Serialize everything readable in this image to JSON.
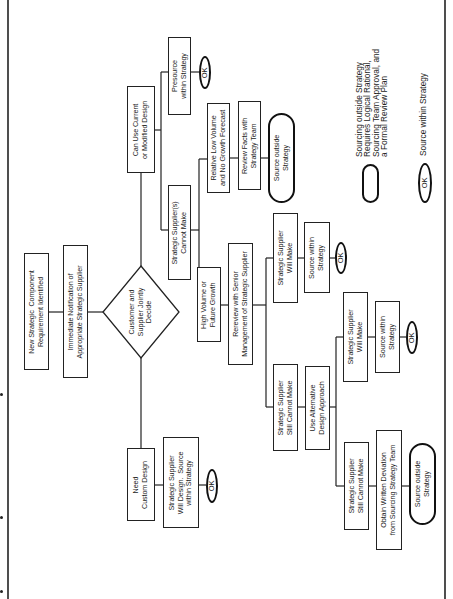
{
  "diagram": {
    "orientation": "rotated-90-ccw",
    "start": {
      "new_requirement": "New Strategic  Component\nRequirement Identified",
      "notification": "Immediate Notification of\nAppropriate Strategic Supplier"
    },
    "decision": "Customer and\nSupplier Jointly\nDecide",
    "branch_current": {
      "label": "Can Use Current\nor Modified Design",
      "presource": "Presource\nwithin Strategy",
      "ok": "OK"
    },
    "branch_cannot_make": {
      "label": "Strategic Supplier(s)\nCannot Make",
      "low_volume": {
        "label": "Relative Low Volume\nand No Growth Forecast",
        "review": "Review Facts with\nStrategy Team",
        "outcome": "Source outside\nStrategy"
      },
      "high_volume": {
        "label": "High Volume or\nFuture Growth",
        "review": "Rereview with Senior\nManagement of Strategic Supplier",
        "will_make": {
          "label": "Strategic Supplier\nWill Make",
          "outcome": "Source within\nStrategy",
          "ok": "OK"
        },
        "still_cannot": {
          "label": "Strategic Supplier\nStill Cannot Make",
          "alternative": "Use Alternative\nDesign Approach",
          "will_make": {
            "label": "Strategic Supplier\nWill Make",
            "outcome": "Source within\nStrategy",
            "ok": "OK"
          },
          "still_cannot": {
            "label": "Strategic Supplier\nStill Cannot Make",
            "deviation": "Obtain Written Deviation\nfrom Sourcing Strategy Team",
            "outcome": "Source outside\nStrategy"
          }
        }
      }
    },
    "branch_custom": {
      "label": "Need\nCustom Design",
      "will_design": "Strategic Supplier\nWill Design.  Source\nwithin Strategy",
      "ok": "OK"
    },
    "legend": {
      "outside_text": "Sourcing outside Strategy\nRequires Logical Rational,\nSourcing Team Approval, and\na Formal Review Plan",
      "within_text": "Source within Strategy",
      "within_symbol": "OK"
    },
    "colors": {
      "line": "#222222",
      "background": "#ffffff",
      "text": "#1a1a1a"
    }
  }
}
